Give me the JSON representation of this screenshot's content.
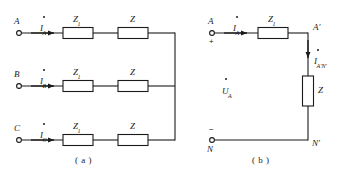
{
  "figure": {
    "ink_color": "#1b1b1b",
    "background_color": "#ffffff",
    "box_fill": "#ffffff"
  },
  "panel_a": {
    "caption": "( a )",
    "rows": [
      {
        "terminal_label": "A",
        "current_label": "I",
        "current_sub": "A",
        "box1_label": "Z",
        "box1_sub": "1",
        "box2_label": "Z",
        "box2_sub": ""
      },
      {
        "terminal_label": "B",
        "current_label": "I",
        "current_sub": "B",
        "box1_label": "Z",
        "box1_sub": "1",
        "box2_label": "Z",
        "box2_sub": ""
      },
      {
        "terminal_label": "C",
        "current_label": "I",
        "current_sub": "C",
        "box1_label": "Z",
        "box1_sub": "1",
        "box2_label": "Z",
        "box2_sub": ""
      }
    ]
  },
  "panel_b": {
    "caption": "( b )",
    "terminal_top_label": "A",
    "terminal_top_sign": "+",
    "terminal_bottom_label": "N",
    "terminal_bottom_sign": "−",
    "current_in_label": "I",
    "current_in_sub": "A",
    "series_box_label": "Z",
    "series_box_sub": "1",
    "node_top_right_label": "A′",
    "node_bottom_right_label": "N′",
    "branch_current_label": "I",
    "branch_current_sub": "A′N′",
    "shunt_box_label": "Z",
    "shunt_box_sub": "",
    "voltage_label": "U",
    "voltage_sub": "A"
  }
}
